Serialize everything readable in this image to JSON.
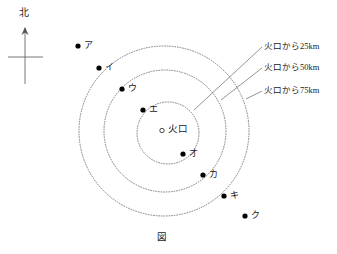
{
  "figure": {
    "caption": "図",
    "north_label": "北",
    "crater": {
      "label": "火口",
      "marker": "open-circle",
      "cx": 168,
      "cy": 133
    },
    "rings": [
      {
        "id": "ring-25km",
        "label": "火口から25km",
        "radius_px": 31,
        "distance_km": 25
      },
      {
        "id": "ring-50km",
        "label": "火口から50km",
        "radius_px": 61,
        "distance_km": 50
      },
      {
        "id": "ring-75km",
        "label": "火口から75km",
        "radius_px": 85,
        "distance_km": 75
      }
    ],
    "points": [
      {
        "id": "point-a",
        "label": "ア",
        "x": 78,
        "y": 46,
        "lx": 84,
        "ly": 41
      },
      {
        "id": "point-i",
        "label": "イ",
        "x": 99,
        "y": 68,
        "lx": 105,
        "ly": 63
      },
      {
        "id": "point-u",
        "label": "ウ",
        "x": 122,
        "y": 89,
        "lx": 128,
        "ly": 84
      },
      {
        "id": "point-e",
        "label": "エ",
        "x": 143,
        "y": 110,
        "lx": 149,
        "ly": 105
      },
      {
        "id": "point-o",
        "label": "オ",
        "x": 183,
        "y": 154,
        "lx": 189,
        "ly": 149
      },
      {
        "id": "point-ka",
        "label": "カ",
        "x": 203,
        "y": 175,
        "lx": 209,
        "ly": 170
      },
      {
        "id": "point-ki",
        "label": "キ",
        "x": 224,
        "y": 196,
        "lx": 230,
        "ly": 191
      },
      {
        "id": "point-ku",
        "label": "ク",
        "x": 245,
        "y": 216,
        "lx": 251,
        "ly": 211
      }
    ],
    "colors": {
      "stroke": "#555555",
      "text": "#1a1a1a",
      "point_fill": "#000000",
      "background": "#ffffff"
    }
  }
}
